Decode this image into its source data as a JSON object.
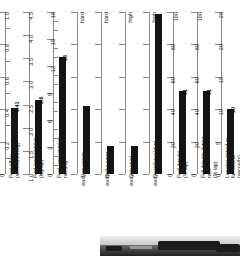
{
  "chart_data": {
    "type": "bar",
    "title": "",
    "layout": "nine side-by-side single-bar gauge charts, vertical bars, value label rotated beside each bar",
    "grid": false,
    "legend": null,
    "charts": [
      {
        "id": "fuel-effect",
        "xlabel": "Fuel effect\n(seconds/10kg)",
        "scale": "numeric",
        "ylim": [
          0,
          1.0
        ],
        "ticks": [
          "0",
          "0.2",
          "0.4",
          "0.6",
          "0.8",
          "1.0"
        ],
        "tick_values": [
          0,
          0.2,
          0.4,
          0.6,
          0.8,
          1.0
        ],
        "minor_per_major": 1,
        "value": 0.41,
        "value_label": "0.41"
      },
      {
        "id": "fuel-consumption",
        "xlabel": "Fuel consumption\n(Kg/lap)",
        "scale": "numeric",
        "ylim": [
          1.0,
          4.5
        ],
        "ticks": [
          "1.0",
          "1.5",
          "2.0",
          "2.5",
          "3.0",
          "3.5",
          "4.0",
          "4.5"
        ],
        "tick_values": [
          1.0,
          1.5,
          2.0,
          2.5,
          3.0,
          3.5,
          4.0,
          4.5
        ],
        "minor_per_major": 0,
        "value": 2.6,
        "value_label": "2.6"
      },
      {
        "id": "fuel-consumption-ranking",
        "xlabel": "Fuel consumption\nranking",
        "scale": "numeric",
        "ylim": [
          0,
          18
        ],
        "ticks": [
          "0",
          "3",
          "6",
          "9",
          "12",
          "15",
          "18"
        ],
        "tick_values": [
          0,
          3,
          6,
          9,
          12,
          15,
          18
        ],
        "minor_per_major": 2,
        "value": 13,
        "value_label": "13"
      },
      {
        "id": "tyre-usage",
        "xlabel": "Tyre usage",
        "scale": "qualitative",
        "ylim": [
          0,
          5
        ],
        "ticks": [
          "easy",
          "",
          "",
          "",
          "",
          "hard"
        ],
        "tick_values": [
          0,
          1,
          2,
          3,
          4,
          5
        ],
        "minor_per_major": 0,
        "value": 2.1,
        "value_label": ""
      },
      {
        "id": "brake-wear",
        "xlabel": "Brake wear",
        "scale": "qualitative",
        "ylim": [
          0,
          5
        ],
        "ticks": [
          "easy",
          "",
          "",
          "",
          "",
          "hard"
        ],
        "tick_values": [
          0,
          1,
          2,
          3,
          4,
          5
        ],
        "minor_per_major": 0,
        "value": 0.85,
        "value_label": ""
      },
      {
        "id": "grip-level",
        "xlabel": "Grip level",
        "scale": "qualitative",
        "ylim": [
          0,
          5
        ],
        "ticks": [
          "easy",
          "",
          "",
          "",
          "",
          "high"
        ],
        "tick_values": [
          0,
          1,
          2,
          3,
          4,
          5
        ],
        "minor_per_major": 0,
        "value": 0.85,
        "value_label": ""
      },
      {
        "id": "downforce-level",
        "xlabel": "Downforce level",
        "scale": "qualitative",
        "ylim": [
          0,
          5
        ],
        "ticks": [
          "easy",
          "",
          "",
          "",
          "",
          "high"
        ],
        "tick_values": [
          0,
          1,
          2,
          3,
          4,
          5
        ],
        "minor_per_major": 0,
        "value": 4.95,
        "value_label": ""
      },
      {
        "id": "fuel-throttle",
        "xlabel": "Fuel throttle\n(% lap)",
        "scale": "numeric",
        "ylim": [
          0,
          100
        ],
        "ticks": [
          "0",
          "20",
          "40",
          "60",
          "80",
          "100"
        ],
        "tick_values": [
          0,
          20,
          40,
          60,
          80,
          100
        ],
        "minor_per_major": 0,
        "value": 51,
        "value_label": "51"
      },
      {
        "id": "full-throttle-during-race",
        "xlabel": "Full throttle during\nrace\n(% lap)",
        "scale": "numeric",
        "ylim": [
          0,
          100
        ],
        "ticks": [
          "0",
          "20",
          "40",
          "60",
          "80",
          "100"
        ],
        "tick_values": [
          0,
          20,
          40,
          60,
          80,
          100
        ],
        "minor_per_major": 0,
        "value": 51,
        "value_label": "51"
      },
      {
        "id": "longest-period-at-full-throttle",
        "xlabel": "Longest period at\nfull throttle\n(seconds)",
        "scale": "numeric",
        "ylim": [
          0,
          25
        ],
        "ticks": [
          "0",
          "5",
          "10",
          "15",
          "20",
          "25"
        ],
        "tick_values": [
          0,
          5,
          10,
          15,
          20,
          25
        ],
        "minor_per_major": 0,
        "value": 10,
        "value_label": "10"
      }
    ],
    "colors": {
      "bar": "#141414",
      "axis": "#8a8a8a",
      "text": "#1a1a1a",
      "background": "#ffffff"
    }
  },
  "photo": {
    "caption": ""
  }
}
